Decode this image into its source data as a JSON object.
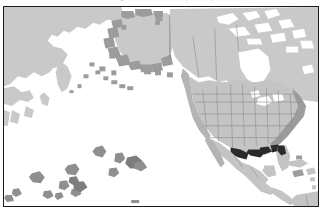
{
  "figure": {
    "caption_remnant": "Figure 1. Distribution (shaded)",
    "frame_color": "#1a1a1a",
    "background_color": "#ffffff"
  },
  "map": {
    "title": "",
    "projection_region": "North Pacific and North America",
    "land_color": "#c9c9c9",
    "ocean_color": "#ffffff",
    "legend_visible": false,
    "scale_bar_visible": false,
    "graticule_visible": false,
    "shading_classes": [
      {
        "name": "land",
        "color": "#c9c9c9",
        "label": ""
      },
      {
        "name": "coastal-band-light",
        "color": "#b4b4b4",
        "label": ""
      },
      {
        "name": "coastal-band-medium",
        "color": "#9c9c9c",
        "label": ""
      },
      {
        "name": "island-occurrence",
        "color": "#8f8f8f",
        "label": ""
      },
      {
        "name": "high-density-hotspot",
        "color": "#2b2b2b",
        "label": ""
      }
    ],
    "regions": [
      {
        "name": "siberia-russia-far-east",
        "class": "land"
      },
      {
        "name": "alaska",
        "class": "coastal-band-medium"
      },
      {
        "name": "aleutian-islands",
        "class": "coastal-band-medium"
      },
      {
        "name": "canada",
        "class": "land"
      },
      {
        "name": "hudson-bay",
        "class": "ocean"
      },
      {
        "name": "arctic-archipelago",
        "class": "land"
      },
      {
        "name": "greenland-edge",
        "class": "land"
      },
      {
        "name": "continental-united-states",
        "class": "land"
      },
      {
        "name": "us-west-coast-band",
        "class": "coastal-band-light"
      },
      {
        "name": "us-east-coast-band",
        "class": "coastal-band-medium"
      },
      {
        "name": "gulf-coast-hotspot",
        "class": "high-density-hotspot"
      },
      {
        "name": "florida-hotspot",
        "class": "high-density-hotspot"
      },
      {
        "name": "mexico",
        "class": "land"
      },
      {
        "name": "central-america",
        "class": "land"
      },
      {
        "name": "caribbean-islands",
        "class": "land"
      },
      {
        "name": "northern-south-america",
        "class": "land"
      },
      {
        "name": "hawaiian-and-pacific-islands",
        "class": "island-occurrence"
      }
    ],
    "state_boundaries_visible": true,
    "alaska_yukon_border_visible": true
  }
}
